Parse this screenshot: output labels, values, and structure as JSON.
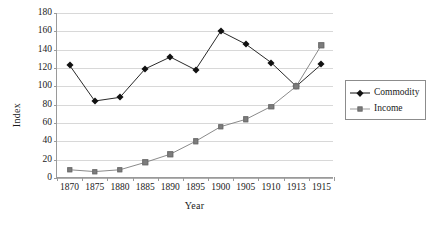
{
  "chart_data": {
    "type": "line",
    "title": "",
    "xlabel": "Year",
    "ylabel": "Index",
    "categories": [
      "1870",
      "1875",
      "1880",
      "1885",
      "1890",
      "1895",
      "1900",
      "1905",
      "1910",
      "1913",
      "1915"
    ],
    "ylim": [
      0,
      180
    ],
    "yticks": [
      0,
      20,
      40,
      60,
      80,
      100,
      120,
      140,
      160,
      180
    ],
    "grid": true,
    "legend_position": "right",
    "series": [
      {
        "name": "Commodity",
        "color": "#111111",
        "marker": "diamond",
        "values": [
          123,
          84,
          88,
          119,
          132,
          118,
          160,
          146,
          126,
          100,
          124
        ]
      },
      {
        "name": "Income",
        "color": "#7d7d7d",
        "marker": "square",
        "values": [
          9,
          7,
          9,
          17,
          26,
          40,
          56,
          64,
          78,
          100,
          145
        ]
      }
    ]
  },
  "legend": {
    "items": [
      {
        "label": "Commodity",
        "marker": "diamond-marker-icon"
      },
      {
        "label": "Income",
        "marker": "square-marker-icon"
      }
    ]
  }
}
